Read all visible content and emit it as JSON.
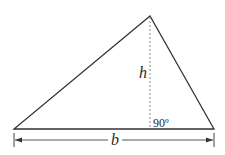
{
  "diagram": {
    "shape": "triangle",
    "vertices": {
      "apex": [
        150,
        16
      ],
      "base_left": [
        14,
        129
      ],
      "base_right": [
        214,
        129
      ]
    },
    "height_line": {
      "style": "dashed",
      "from": [
        150,
        16
      ],
      "to": [
        150,
        129
      ]
    },
    "labels": {
      "height": "h",
      "angle": "90º",
      "base": "b"
    },
    "base_dimension": {
      "y": 140,
      "from_x": 14,
      "to_x": 214,
      "arrows": "both-ends"
    },
    "colors": {
      "stroke": "#333333",
      "dashed": "#888888",
      "text": "#2a2a2a",
      "background": "#ffffff"
    }
  }
}
